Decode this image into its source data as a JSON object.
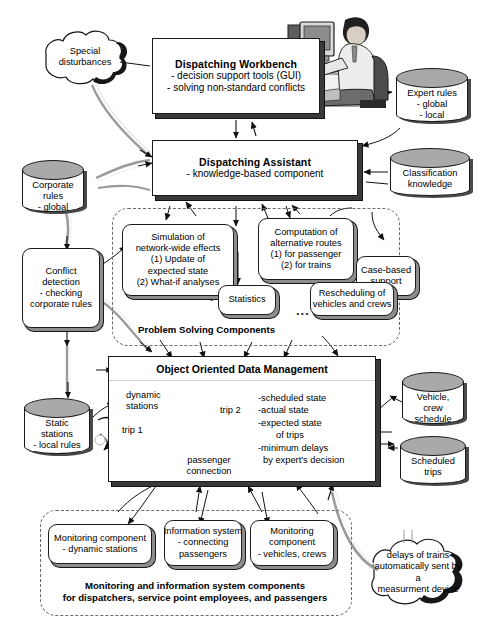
{
  "diagram": {
    "clouds": [
      {
        "id": "special-disturbances",
        "lines": [
          "Special",
          "disturbances"
        ]
      },
      {
        "id": "delays-measurement",
        "lines": [
          "delays of trains",
          "automatically sent by a",
          "measurment device"
        ]
      }
    ],
    "databases": [
      {
        "id": "corporate-rules",
        "lines": [
          "Corporate",
          "rules",
          "- global"
        ]
      },
      {
        "id": "expert-rules",
        "lines": [
          "Expert rules",
          "- global",
          "- local"
        ]
      },
      {
        "id": "classification-knowledge",
        "lines": [
          "Classification",
          "knowledge"
        ]
      },
      {
        "id": "static-stations",
        "lines": [
          "Static",
          "stations",
          "- local rules"
        ]
      },
      {
        "id": "vehicle-crew-schedule",
        "lines": [
          "Vehicle,",
          "crew",
          "schedule"
        ]
      },
      {
        "id": "scheduled-trips",
        "lines": [
          "Scheduled",
          "trips"
        ]
      }
    ],
    "workbench": {
      "title": "Dispatching Workbench",
      "lines": [
        "- decision support tools (GUI)",
        "- solving non-standard conflicts"
      ]
    },
    "assistant": {
      "title": "Dispatching Assistant",
      "lines": [
        "- knowledge-based component"
      ]
    },
    "conflict_detection": {
      "lines": [
        "Conflict",
        "detection",
        "- checking",
        "corporate rules"
      ]
    },
    "problem_solving": {
      "label": "Problem Solving Components",
      "ellipsis": "...",
      "components": [
        {
          "id": "simulation",
          "lines": [
            "Simulation of",
            "network-wide effects",
            "(1) Update of",
            "expected state",
            "(2) What-if analyses"
          ]
        },
        {
          "id": "computation-routes",
          "lines": [
            "Computation of",
            "alternative routes",
            "(1) for passenger",
            "(2) for trains"
          ]
        },
        {
          "id": "case-based-support",
          "lines": [
            "Case-based",
            "support"
          ]
        },
        {
          "id": "statistics",
          "lines": [
            "Statistics"
          ]
        },
        {
          "id": "rescheduling",
          "lines": [
            "Rescheduling of",
            "vehicles and crews"
          ]
        }
      ]
    },
    "oodm": {
      "title": "Object Oriented Data Management",
      "graph_labels": {
        "dynamic_stations": [
          "dynamic",
          "stations"
        ],
        "trip1": "trip 1",
        "trip2": "trip 2",
        "passenger_connection": [
          "passenger",
          "connection"
        ]
      },
      "state_lines": [
        "-scheduled state",
        "-actual state",
        "-expected state",
        "of trips",
        "-minimum delays",
        "by expert's decision"
      ]
    },
    "monitoring": {
      "label_lines": [
        "Monitoring and information system components",
        "for dispatchers, service point employees, and passengers"
      ],
      "components": [
        {
          "id": "monitoring-dynamic-stations",
          "lines": [
            "Monitoring component",
            "- dynamic stations"
          ]
        },
        {
          "id": "information-system",
          "lines": [
            "Information system",
            "- connecting",
            "passengers"
          ]
        },
        {
          "id": "monitoring-vehicles-crews",
          "lines": [
            "Monitoring",
            "component",
            "- vehicles, crews"
          ]
        }
      ]
    },
    "illustration": {
      "id": "workstation-operator",
      "alt": "person working at a desktop computer"
    }
  }
}
